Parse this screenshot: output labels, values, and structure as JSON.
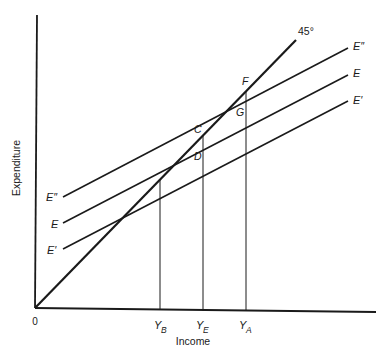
{
  "diagram": {
    "axes": {
      "x_label": "Income",
      "y_label": "Expenditure",
      "origin_label": "0"
    },
    "lines": {
      "forty_five": {
        "label": "45°"
      },
      "e_double_prime": {
        "label": "E″",
        "left_label": "E″"
      },
      "e": {
        "label": "E",
        "left_label": "E"
      },
      "e_prime": {
        "label": "E′",
        "left_label": "E′"
      }
    },
    "points": {
      "F": "F",
      "G": "G",
      "C": "C",
      "D": "D"
    },
    "x_ticks": [
      {
        "main": "Y",
        "sub": "B"
      },
      {
        "main": "Y",
        "sub": "E"
      },
      {
        "main": "Y",
        "sub": "A"
      }
    ]
  }
}
